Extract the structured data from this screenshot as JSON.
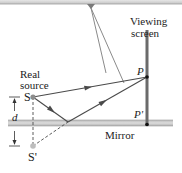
{
  "diagram": {
    "labels": {
      "viewing_screen_line1": "Viewing",
      "viewing_screen_line2": "screen",
      "real_source_line1": "Real",
      "real_source_line2": "source",
      "source": "S",
      "image_source": "S'",
      "point_p": "P",
      "point_p_prime": "P'",
      "distance": "d",
      "mirror": "Mirror"
    },
    "colors": {
      "ray": "#4a4a4a",
      "screen": "#6b6b6b",
      "mirror": "#c8c8c8",
      "mirror_edge": "#9a9a9a",
      "top_bar": "#d6d6d6",
      "source_dot": "#8c8c8c",
      "text": "#222222"
    }
  }
}
